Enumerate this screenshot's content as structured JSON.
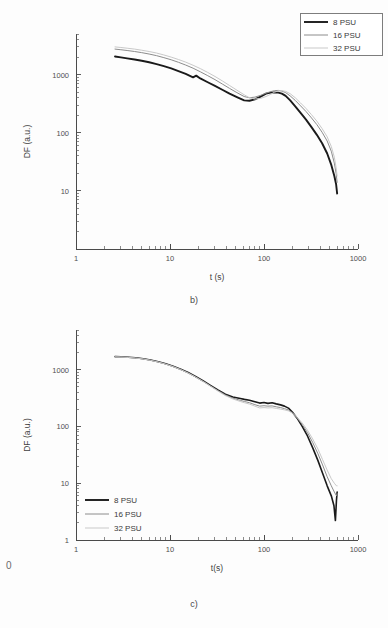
{
  "figure": {
    "margin_mark": "0",
    "panels": [
      {
        "id": "b",
        "caption": "b)"
      },
      {
        "id": "c",
        "caption": "c)"
      }
    ]
  },
  "colors": {
    "series_8psu": "#1a1a1a",
    "series_16psu": "#8c8c8c",
    "series_32psu": "#c9c9c9",
    "axis": "#4a4a4a",
    "text": "#3a3a3a",
    "background": "#fdfdfd"
  },
  "panel_b": {
    "caption": "b)",
    "legend": {
      "position": "top-right",
      "boxed": true,
      "entries": [
        {
          "label": "8 PSU",
          "color": "#1a1a1a",
          "width": 1.9
        },
        {
          "label": "16 PSU",
          "color": "#8c8c8c",
          "width": 1.0
        },
        {
          "label": "32 PSU",
          "color": "#c9c9c9",
          "width": 1.0
        }
      ]
    }
  },
  "panel_c": {
    "caption": "c)",
    "legend": {
      "position": "bottom-left",
      "boxed": false,
      "entries": [
        {
          "label": "8 PSU",
          "color": "#1a1a1a",
          "width": 1.9
        },
        {
          "label": "16 PSU",
          "color": "#8c8c8c",
          "width": 1.0
        },
        {
          "label": "32 PSU",
          "color": "#c9c9c9",
          "width": 1.0
        }
      ]
    }
  },
  "chart_data": [
    {
      "panel": "b",
      "type": "line",
      "title": "",
      "xlabel": "t (s)",
      "ylabel": "DF (a.u.)",
      "xscale": "log",
      "yscale": "log",
      "xlim": [
        1,
        1000
      ],
      "ylim": [
        1,
        5000
      ],
      "xticks": [
        1,
        10,
        100,
        1000
      ],
      "xticklabels": [
        "1",
        "10",
        "100",
        "1000"
      ],
      "yticks": [
        10,
        100,
        1000
      ],
      "yticklabels": [
        "10",
        "100",
        "1000"
      ],
      "grid": false,
      "legend_position": "upper right",
      "series": [
        {
          "name": "8 PSU",
          "color": "#1a1a1a",
          "x": [
            2.6,
            3.0,
            3.5,
            4.2,
            5.0,
            6.0,
            7.2,
            8.6,
            10.3,
            12.3,
            14.7,
            17.6,
            19.0,
            21.0,
            25.2,
            30.1,
            36.0,
            43.0,
            51.5,
            61.5,
            70.0,
            80.0,
            92.0,
            105.0,
            118.0,
            130.0,
            142.0,
            155.0,
            170.0,
            190.0,
            215.0,
            245.0,
            280.0,
            320.0,
            365.0,
            415.0,
            470.0,
            520.0,
            560.0,
            585.0,
            600.0
          ],
          "y": [
            2050,
            1980,
            1900,
            1820,
            1730,
            1630,
            1520,
            1400,
            1280,
            1150,
            1030,
            900,
            960,
            860,
            740,
            640,
            550,
            470,
            410,
            360,
            355,
            375,
            420,
            470,
            490,
            495,
            490,
            470,
            430,
            360,
            285,
            220,
            168,
            125,
            92,
            66,
            44,
            28,
            18,
            13,
            9
          ],
          "lw": 1.9
        },
        {
          "name": "16 PSU",
          "color": "#8c8c8c",
          "x": [
            2.6,
            3.0,
            3.5,
            4.2,
            5.0,
            6.0,
            7.2,
            8.6,
            10.3,
            12.3,
            14.7,
            17.6,
            21.0,
            25.2,
            30.1,
            36.0,
            43.0,
            51.5,
            61.5,
            70.0,
            80.0,
            92.0,
            105.0,
            118.0,
            130.0,
            142.0,
            155.0,
            170.0,
            190.0,
            215.0,
            245.0,
            280.0,
            320.0,
            365.0,
            415.0,
            470.0,
            520.0,
            560.0,
            585.0,
            600.0
          ],
          "y": [
            2750,
            2680,
            2600,
            2500,
            2390,
            2260,
            2120,
            1960,
            1800,
            1630,
            1460,
            1290,
            1120,
            960,
            820,
            690,
            580,
            490,
            420,
            400,
            410,
            440,
            480,
            510,
            530,
            535,
            520,
            490,
            430,
            360,
            290,
            232,
            180,
            138,
            102,
            72,
            48,
            30,
            20,
            14
          ],
          "lw": 1.0
        },
        {
          "name": "32 PSU",
          "color": "#c9c9c9",
          "x": [
            2.6,
            3.0,
            3.5,
            4.2,
            5.0,
            6.0,
            7.2,
            8.6,
            10.3,
            12.3,
            14.7,
            17.6,
            21.0,
            25.2,
            30.1,
            36.0,
            43.0,
            51.5,
            61.5,
            70.0,
            80.0,
            92.0,
            105.0,
            118.0,
            130.0,
            142.0,
            155.0,
            170.0,
            190.0,
            215.0,
            245.0,
            280.0,
            320.0,
            365.0,
            415.0,
            470.0,
            520.0,
            560.0,
            585.0,
            600.0
          ],
          "y": [
            3000,
            2930,
            2850,
            2750,
            2630,
            2500,
            2350,
            2180,
            2000,
            1820,
            1640,
            1450,
            1270,
            1090,
            930,
            780,
            650,
            540,
            450,
            400,
            380,
            390,
            420,
            460,
            500,
            525,
            530,
            515,
            470,
            400,
            325,
            262,
            205,
            158,
            118,
            85,
            58,
            38,
            25,
            18
          ],
          "lw": 1.0
        }
      ]
    },
    {
      "panel": "c",
      "type": "line",
      "title": "",
      "xlabel": "t(s)",
      "ylabel": "DF (a.u.)",
      "xscale": "log",
      "yscale": "log",
      "xlim": [
        1,
        1000
      ],
      "ylim": [
        1,
        5000
      ],
      "xticks": [
        1,
        10,
        100,
        1000
      ],
      "xticklabels": [
        "1",
        "10",
        "100",
        "1000"
      ],
      "yticks": [
        1,
        10,
        100,
        1000
      ],
      "yticklabels": [
        "1",
        "10",
        "100",
        "1000"
      ],
      "grid": false,
      "legend_position": "lower left",
      "series": [
        {
          "name": "8 PSU",
          "color": "#1a1a1a",
          "x": [
            2.6,
            3.0,
            3.6,
            4.3,
            5.2,
            6.2,
            7.5,
            9.0,
            10.8,
            13.0,
            15.6,
            18.7,
            22.4,
            26.9,
            32.3,
            38.8,
            46.6,
            56.0,
            62.0,
            70.0,
            80.0,
            90.0,
            100.0,
            110.0,
            122.0,
            135.0,
            150.0,
            165.0,
            182.0,
            200.0,
            225.0,
            255.0,
            290.0,
            330.0,
            375.0,
            420.0,
            470.0,
            520.0,
            555.0,
            575.0,
            590.0,
            600.0
          ],
          "y": [
            1700,
            1690,
            1660,
            1620,
            1560,
            1480,
            1380,
            1270,
            1150,
            1020,
            890,
            760,
            640,
            530,
            440,
            370,
            330,
            310,
            300,
            290,
            272,
            258,
            265,
            255,
            262,
            250,
            240,
            228,
            210,
            180,
            140,
            100,
            68,
            42,
            25,
            15,
            9,
            6,
            4,
            2.2,
            5,
            7
          ],
          "lw": 1.6
        },
        {
          "name": "16 PSU",
          "color": "#8c8c8c",
          "x": [
            2.6,
            3.0,
            3.6,
            4.3,
            5.2,
            6.2,
            7.5,
            9.0,
            10.8,
            13.0,
            15.6,
            18.7,
            22.4,
            26.9,
            32.3,
            38.8,
            46.6,
            56.0,
            62.0,
            70.0,
            80.0,
            90.0,
            100.0,
            110.0,
            122.0,
            135.0,
            150.0,
            165.0,
            182.0,
            200.0,
            225.0,
            255.0,
            290.0,
            330.0,
            375.0,
            420.0,
            470.0,
            520.0,
            560.0,
            590.0,
            600.0
          ],
          "y": [
            1690,
            1680,
            1650,
            1610,
            1550,
            1470,
            1370,
            1260,
            1140,
            1010,
            880,
            750,
            630,
            520,
            430,
            360,
            315,
            288,
            275,
            262,
            242,
            228,
            232,
            228,
            230,
            222,
            215,
            206,
            195,
            175,
            142,
            108,
            78,
            52,
            33,
            21,
            13,
            9,
            7,
            6,
            6.5
          ],
          "lw": 1.0
        },
        {
          "name": "32 PSU",
          "color": "#c9c9c9",
          "x": [
            2.6,
            3.0,
            3.6,
            4.3,
            5.2,
            6.2,
            7.5,
            9.0,
            10.8,
            13.0,
            15.6,
            18.7,
            22.4,
            26.9,
            32.3,
            38.8,
            46.6,
            56.0,
            62.0,
            70.0,
            80.0,
            90.0,
            100.0,
            110.0,
            122.0,
            135.0,
            150.0,
            165.0,
            182.0,
            200.0,
            225.0,
            255.0,
            290.0,
            330.0,
            375.0,
            420.0,
            470.0,
            520.0,
            560.0,
            590.0,
            600.0
          ],
          "y": [
            1680,
            1670,
            1640,
            1600,
            1540,
            1460,
            1360,
            1250,
            1130,
            1000,
            870,
            740,
            620,
            512,
            420,
            350,
            305,
            275,
            262,
            248,
            228,
            212,
            215,
            212,
            214,
            208,
            202,
            196,
            188,
            172,
            145,
            115,
            86,
            60,
            40,
            26,
            17,
            12,
            10,
            9,
            9
          ],
          "lw": 1.0
        }
      ]
    }
  ]
}
